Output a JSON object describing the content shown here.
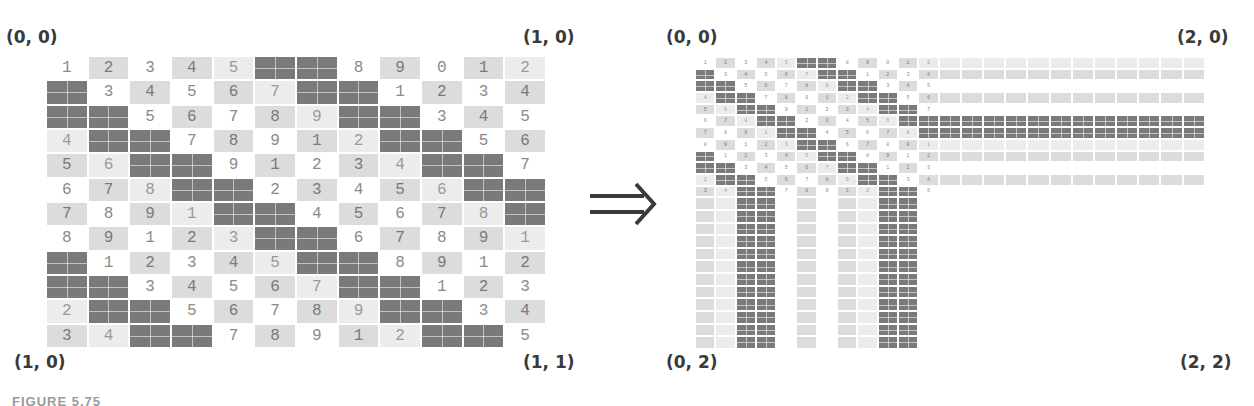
{
  "figure": {
    "caption_partial": "FIGURE 5.75",
    "arrow_symbol": "implies-double-arrow",
    "left_panel": {
      "labels": {
        "top_left": "(0, 0)",
        "top_right": "(1, 0)",
        "bottom_left": "(1, 0)",
        "bottom_right": "(1, 1)"
      },
      "rows": 12,
      "cols": 12,
      "grid": [
        [
          [
            "1",
            "w"
          ],
          [
            "2",
            "l"
          ],
          [
            "3",
            "w"
          ],
          [
            "4",
            "l"
          ],
          [
            "5",
            "v"
          ],
          [
            "",
            "d"
          ],
          [
            "",
            "d"
          ],
          [
            "8",
            "w"
          ],
          [
            "9",
            "l"
          ],
          [
            "0",
            "w"
          ],
          [
            "1",
            "l"
          ],
          [
            "2",
            "v"
          ]
        ],
        [
          [
            "",
            "d"
          ],
          [
            "3",
            "w"
          ],
          [
            "4",
            "l"
          ],
          [
            "5",
            "w"
          ],
          [
            "6",
            "l"
          ],
          [
            "7",
            "v"
          ],
          [
            "",
            "d"
          ],
          [
            "",
            "d"
          ],
          [
            "1",
            "w"
          ],
          [
            "2",
            "l"
          ],
          [
            "3",
            "w"
          ],
          [
            "4",
            "l"
          ]
        ],
        [
          [
            "",
            "d"
          ],
          [
            "",
            "d"
          ],
          [
            "5",
            "w"
          ],
          [
            "6",
            "l"
          ],
          [
            "7",
            "w"
          ],
          [
            "8",
            "l"
          ],
          [
            "9",
            "v"
          ],
          [
            "",
            "d"
          ],
          [
            "",
            "d"
          ],
          [
            "3",
            "w"
          ],
          [
            "4",
            "l"
          ],
          [
            "5",
            "w"
          ]
        ],
        [
          [
            "4",
            "v"
          ],
          [
            "",
            "d"
          ],
          [
            "",
            "d"
          ],
          [
            "7",
            "w"
          ],
          [
            "8",
            "l"
          ],
          [
            "9",
            "w"
          ],
          [
            "1",
            "l"
          ],
          [
            "2",
            "v"
          ],
          [
            "",
            "d"
          ],
          [
            "",
            "d"
          ],
          [
            "5",
            "w"
          ],
          [
            "6",
            "l"
          ]
        ],
        [
          [
            "5",
            "l"
          ],
          [
            "6",
            "v"
          ],
          [
            "",
            "d"
          ],
          [
            "",
            "d"
          ],
          [
            "9",
            "w"
          ],
          [
            "1",
            "l"
          ],
          [
            "2",
            "w"
          ],
          [
            "3",
            "l"
          ],
          [
            "4",
            "v"
          ],
          [
            "",
            "d"
          ],
          [
            "",
            "d"
          ],
          [
            "7",
            "w"
          ]
        ],
        [
          [
            "6",
            "w"
          ],
          [
            "7",
            "l"
          ],
          [
            "8",
            "v"
          ],
          [
            "",
            "d"
          ],
          [
            "",
            "d"
          ],
          [
            "2",
            "w"
          ],
          [
            "3",
            "l"
          ],
          [
            "4",
            "w"
          ],
          [
            "5",
            "l"
          ],
          [
            "6",
            "v"
          ],
          [
            "",
            "d"
          ],
          [
            "",
            "d"
          ]
        ],
        [
          [
            "7",
            "l"
          ],
          [
            "8",
            "w"
          ],
          [
            "9",
            "l"
          ],
          [
            "1",
            "v"
          ],
          [
            "",
            "d"
          ],
          [
            "",
            "d"
          ],
          [
            "4",
            "w"
          ],
          [
            "5",
            "l"
          ],
          [
            "6",
            "w"
          ],
          [
            "7",
            "l"
          ],
          [
            "8",
            "v"
          ],
          [
            "",
            "d"
          ]
        ],
        [
          [
            "8",
            "w"
          ],
          [
            "9",
            "l"
          ],
          [
            "1",
            "w"
          ],
          [
            "2",
            "l"
          ],
          [
            "3",
            "v"
          ],
          [
            "",
            "d"
          ],
          [
            "",
            "d"
          ],
          [
            "6",
            "w"
          ],
          [
            "7",
            "l"
          ],
          [
            "8",
            "w"
          ],
          [
            "9",
            "l"
          ],
          [
            "1",
            "v"
          ]
        ],
        [
          [
            "",
            "d"
          ],
          [
            "1",
            "w"
          ],
          [
            "2",
            "l"
          ],
          [
            "3",
            "w"
          ],
          [
            "4",
            "l"
          ],
          [
            "5",
            "v"
          ],
          [
            "",
            "d"
          ],
          [
            "",
            "d"
          ],
          [
            "8",
            "w"
          ],
          [
            "9",
            "l"
          ],
          [
            "1",
            "w"
          ],
          [
            "2",
            "l"
          ]
        ],
        [
          [
            "",
            "d"
          ],
          [
            "",
            "d"
          ],
          [
            "3",
            "w"
          ],
          [
            "4",
            "l"
          ],
          [
            "5",
            "w"
          ],
          [
            "6",
            "l"
          ],
          [
            "7",
            "v"
          ],
          [
            "",
            "d"
          ],
          [
            "",
            "d"
          ],
          [
            "1",
            "w"
          ],
          [
            "2",
            "l"
          ],
          [
            "3",
            "w"
          ]
        ],
        [
          [
            "2",
            "v"
          ],
          [
            "",
            "d"
          ],
          [
            "",
            "d"
          ],
          [
            "5",
            "w"
          ],
          [
            "6",
            "l"
          ],
          [
            "7",
            "w"
          ],
          [
            "8",
            "l"
          ],
          [
            "9",
            "v"
          ],
          [
            "",
            "d"
          ],
          [
            "",
            "d"
          ],
          [
            "3",
            "w"
          ],
          [
            "4",
            "l"
          ]
        ],
        [
          [
            "3",
            "l"
          ],
          [
            "4",
            "v"
          ],
          [
            "",
            "d"
          ],
          [
            "",
            "d"
          ],
          [
            "7",
            "w"
          ],
          [
            "8",
            "l"
          ],
          [
            "9",
            "w"
          ],
          [
            "1",
            "l"
          ],
          [
            "2",
            "v"
          ],
          [
            "",
            "d"
          ],
          [
            "",
            "d"
          ],
          [
            "5",
            "w"
          ]
        ]
      ]
    },
    "right_panel": {
      "labels": {
        "top_left": "(0, 0)",
        "top_right": "(2, 0)",
        "bottom_left": "(0, 2)",
        "bottom_right": "(2, 2)"
      },
      "description": "Original 12x12 texture in top-left; last column stretched to the right and last row stretched downward (clamp-to-edge).",
      "extend_right_cols": 12,
      "extend_down_rows": 12
    },
    "shade_colors": {
      "w": "#ffffff",
      "v": "#ececec",
      "l": "#dcdcdc",
      "m": "#cfcfcf",
      "d": "#7a7a7a"
    }
  }
}
